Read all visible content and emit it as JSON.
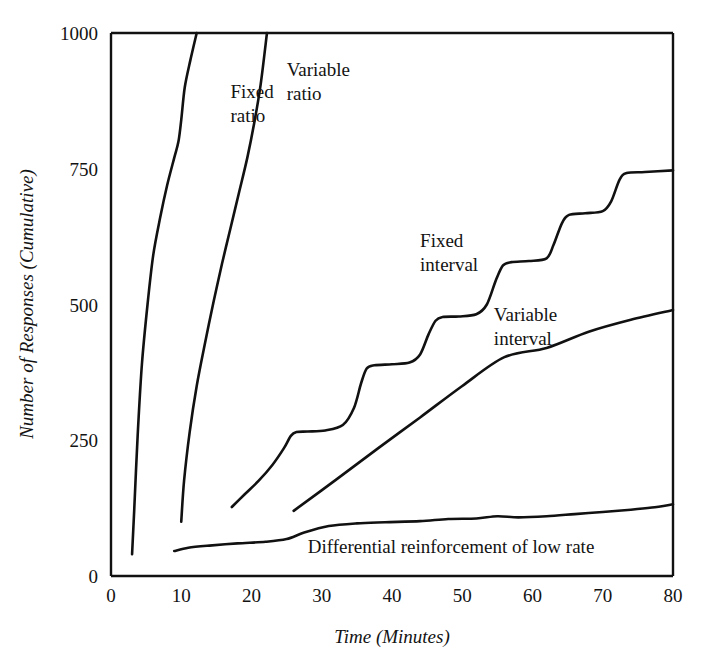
{
  "chart_data": {
    "type": "line",
    "title": "",
    "xlabel": "Time (Minutes)",
    "ylabel": "Number of Responses (Cumulative)",
    "xlim": [
      0,
      80
    ],
    "ylim": [
      0,
      1000
    ],
    "xticks": [
      0,
      10,
      20,
      30,
      40,
      50,
      60,
      70,
      80
    ],
    "xtick_labels": [
      "0",
      "10",
      "20",
      "30",
      "40",
      "50",
      "60",
      "70",
      "80"
    ],
    "yticks": [
      0,
      250,
      500,
      750,
      1000
    ],
    "ytick_labels": [
      "0",
      "250",
      "500",
      "750",
      "1000"
    ],
    "grid": false,
    "legend_position": "inline-annotations",
    "series": [
      {
        "name": "Fixed ratio",
        "label_lines": [
          "Fixed",
          "ratio"
        ],
        "points": [
          [
            3.0,
            40
          ],
          [
            3.3,
            120
          ],
          [
            3.8,
            260
          ],
          [
            4.4,
            390
          ],
          [
            5.2,
            500
          ],
          [
            6.0,
            590
          ],
          [
            7.0,
            660
          ],
          [
            8.0,
            720
          ],
          [
            9.0,
            770
          ],
          [
            9.6,
            800
          ],
          [
            10.0,
            840
          ],
          [
            10.5,
            900
          ],
          [
            11.3,
            950
          ],
          [
            12.2,
            1000
          ]
        ]
      },
      {
        "name": "Variable ratio",
        "label_lines": [
          "Variable",
          "ratio"
        ],
        "points": [
          [
            10.0,
            100
          ],
          [
            10.4,
            175
          ],
          [
            11.2,
            265
          ],
          [
            12.2,
            350
          ],
          [
            13.4,
            430
          ],
          [
            14.6,
            505
          ],
          [
            15.8,
            575
          ],
          [
            17.0,
            640
          ],
          [
            18.2,
            705
          ],
          [
            19.4,
            770
          ],
          [
            20.4,
            835
          ],
          [
            21.3,
            905
          ],
          [
            22.2,
            1000
          ]
        ]
      },
      {
        "name": "Fixed interval",
        "label_lines": [
          "Fixed",
          "interval"
        ],
        "points": [
          [
            17.2,
            127
          ],
          [
            19.0,
            150
          ],
          [
            21.0,
            175
          ],
          [
            23.0,
            205
          ],
          [
            24.6,
            235
          ],
          [
            25.6,
            258
          ],
          [
            26.4,
            265
          ],
          [
            28.0,
            266
          ],
          [
            30.5,
            268
          ],
          [
            33.0,
            278
          ],
          [
            34.6,
            310
          ],
          [
            35.6,
            355
          ],
          [
            36.4,
            382
          ],
          [
            37.5,
            388
          ],
          [
            40.0,
            390
          ],
          [
            42.5,
            393
          ],
          [
            44.0,
            408
          ],
          [
            45.2,
            445
          ],
          [
            46.2,
            470
          ],
          [
            47.2,
            477
          ],
          [
            49.5,
            478
          ],
          [
            52.0,
            482
          ],
          [
            53.5,
            500
          ],
          [
            54.8,
            545
          ],
          [
            55.8,
            572
          ],
          [
            57.0,
            578
          ],
          [
            59.5,
            580
          ],
          [
            62.0,
            585
          ],
          [
            63.0,
            610
          ],
          [
            64.2,
            650
          ],
          [
            65.2,
            665
          ],
          [
            67.5,
            668
          ],
          [
            70.0,
            672
          ],
          [
            71.2,
            690
          ],
          [
            72.4,
            730
          ],
          [
            73.4,
            742
          ],
          [
            76.0,
            744
          ],
          [
            80.0,
            747
          ]
        ]
      },
      {
        "name": "Variable interval",
        "label_lines": [
          "Variable",
          "interval"
        ],
        "points": [
          [
            26.0,
            120
          ],
          [
            32.0,
            177
          ],
          [
            38.0,
            235
          ],
          [
            44.0,
            292
          ],
          [
            50.0,
            350
          ],
          [
            56.0,
            403
          ],
          [
            62.0,
            420
          ],
          [
            68.0,
            450
          ],
          [
            74.0,
            472
          ],
          [
            80.0,
            490
          ]
        ]
      },
      {
        "name": "Differential reinforcement of low rate",
        "label_lines": [
          "Differential reinforcement of low rate"
        ],
        "points": [
          [
            9.0,
            46
          ],
          [
            11.0,
            52
          ],
          [
            14.0,
            56
          ],
          [
            18.0,
            60
          ],
          [
            22.0,
            63
          ],
          [
            25.0,
            68
          ],
          [
            27.5,
            80
          ],
          [
            31.0,
            92
          ],
          [
            35.0,
            97
          ],
          [
            39.0,
            99
          ],
          [
            44.0,
            101
          ],
          [
            48.0,
            105
          ],
          [
            52.0,
            106
          ],
          [
            55.0,
            110
          ],
          [
            58.0,
            108
          ],
          [
            62.0,
            110
          ],
          [
            66.0,
            114
          ],
          [
            70.0,
            118
          ],
          [
            74.0,
            122
          ],
          [
            77.0,
            126
          ],
          [
            80.0,
            132
          ]
        ]
      }
    ],
    "annotations": [
      {
        "text_lines": [
          "Fixed",
          "ratio"
        ],
        "x": 17,
        "y": 880
      },
      {
        "text_lines": [
          "Variable",
          "ratio"
        ],
        "x": 25,
        "y": 920
      },
      {
        "text_lines": [
          "Fixed",
          "interval"
        ],
        "x": 44,
        "y": 605
      },
      {
        "text_lines": [
          "Variable",
          "interval"
        ],
        "x": 54.5,
        "y": 470
      },
      {
        "text_lines": [
          "Differential reinforcement of low rate"
        ],
        "x": 28,
        "y": 42
      }
    ]
  }
}
